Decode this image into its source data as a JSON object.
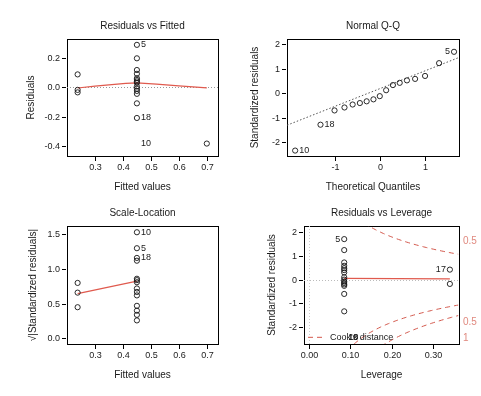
{
  "figure": {
    "background": "#ffffff",
    "axis_color": "#000000",
    "text_color": "#1a1a1a",
    "accent_color": "#e05a4e",
    "cook_color": "#d4594d",
    "layout": "2x2 grid of regression diagnostic plots"
  },
  "chart_data": [
    {
      "type": "scatter",
      "title": "Residuals vs Fitted",
      "xlabel": "Fitted values",
      "ylabel": "Residuals",
      "xlim": [
        0.2,
        0.74
      ],
      "ylim": [
        -0.47,
        0.33
      ],
      "xticks": [
        0.3,
        0.4,
        0.5,
        0.6,
        0.7
      ],
      "xticklabels": [
        "0.3",
        "0.4",
        "0.5",
        "0.6",
        "0.7"
      ],
      "yticks": [
        -0.4,
        -0.2,
        0.0,
        0.2
      ],
      "yticklabels": [
        "-0.4",
        "-0.2",
        "0.0",
        "0.2"
      ],
      "grid": false,
      "legend": "none",
      "x": [
        0.238,
        0.238,
        0.238,
        0.45,
        0.45,
        0.45,
        0.45,
        0.45,
        0.45,
        0.45,
        0.45,
        0.45,
        0.45,
        0.45,
        0.45,
        0.45,
        0.45,
        0.7
      ],
      "y": [
        0.088,
        -0.018,
        -0.035,
        0.29,
        0.198,
        0.118,
        0.092,
        0.062,
        0.05,
        0.04,
        0.03,
        0.005,
        -0.01,
        -0.025,
        -0.045,
        -0.11,
        -0.21,
        -0.385
      ],
      "annotations": [
        {
          "label": "5",
          "x": 0.45,
          "y": 0.29,
          "side": "right"
        },
        {
          "label": "18",
          "x": 0.45,
          "y": -0.21,
          "side": "right"
        },
        {
          "label": "10",
          "x": 0.45,
          "y": -0.385,
          "side": "right"
        }
      ],
      "reference_line": {
        "kind": "zero-dotted",
        "y": 0.0,
        "color": "#999999"
      },
      "smoother": {
        "kind": "lowess",
        "color": "#e05a4e",
        "x": [
          0.238,
          0.3,
          0.36,
          0.41,
          0.45,
          0.52,
          0.6,
          0.7
        ],
        "y": [
          -0.005,
          0.008,
          0.018,
          0.026,
          0.03,
          0.022,
          0.01,
          -0.004
        ]
      }
    },
    {
      "type": "scatter",
      "title": "Normal Q-Q",
      "xlabel": "Theoretical Quantiles",
      "ylabel": "Standardized residuals",
      "xlim": [
        -2.05,
        1.75
      ],
      "ylim": [
        -2.55,
        2.2
      ],
      "xticks": [
        -1,
        0,
        1
      ],
      "xticklabels": [
        "-1",
        "0",
        "1"
      ],
      "yticks": [
        -2,
        -1,
        0,
        1,
        2
      ],
      "yticklabels": [
        "-2",
        "-1",
        "0",
        "1",
        "2"
      ],
      "grid": false,
      "legend": "none",
      "x": [
        -1.87,
        -1.31,
        -1.0,
        -0.78,
        -0.6,
        -0.44,
        -0.29,
        -0.14,
        0.0,
        0.14,
        0.29,
        0.44,
        0.6,
        0.78,
        1.0,
        1.31,
        1.64
      ],
      "y": [
        -2.33,
        -1.28,
        -0.7,
        -0.58,
        -0.46,
        -0.4,
        -0.33,
        -0.25,
        -0.12,
        0.12,
        0.33,
        0.42,
        0.52,
        0.58,
        0.7,
        1.22,
        1.68
      ],
      "annotations": [
        {
          "label": "10",
          "x": -1.87,
          "y": -2.33,
          "side": "right"
        },
        {
          "label": "18",
          "x": -1.31,
          "y": -1.28,
          "side": "right"
        },
        {
          "label": "5",
          "x": 1.64,
          "y": 1.68,
          "side": "left"
        }
      ],
      "reference_line": {
        "kind": "qq-dotted",
        "color": "#555555",
        "p1": [
          -2.05,
          -1.3
        ],
        "p2": [
          1.75,
          1.45
        ]
      }
    },
    {
      "type": "scatter",
      "title": "Scale-Location",
      "xlabel": "Fitted values",
      "ylabel": "√|Standardized residuals|",
      "xlim": [
        0.2,
        0.74
      ],
      "ylim": [
        -0.08,
        1.62
      ],
      "xticks": [
        0.3,
        0.4,
        0.5,
        0.6,
        0.7
      ],
      "xticklabels": [
        "0.3",
        "0.4",
        "0.5",
        "0.6",
        "0.7"
      ],
      "yticks": [
        0.0,
        0.5,
        1.0,
        1.5
      ],
      "yticklabels": [
        "0.0",
        "0.5",
        "1.0",
        "1.5"
      ],
      "grid": false,
      "legend": "none",
      "x": [
        0.238,
        0.238,
        0.238,
        0.45,
        0.45,
        0.45,
        0.45,
        0.45,
        0.45,
        0.45,
        0.45,
        0.45,
        0.45,
        0.45,
        0.45,
        0.45,
        0.45
      ],
      "y": [
        0.8,
        0.66,
        0.45,
        1.53,
        1.3,
        1.16,
        1.12,
        0.86,
        0.84,
        0.81,
        0.72,
        0.67,
        0.62,
        0.47,
        0.4,
        0.34,
        0.26
      ],
      "annotations": [
        {
          "label": "10",
          "x": 0.45,
          "y": 1.53,
          "side": "right"
        },
        {
          "label": "5",
          "x": 0.45,
          "y": 1.3,
          "side": "right"
        },
        {
          "label": "18",
          "x": 0.45,
          "y": 1.16,
          "side": "right"
        }
      ],
      "smoother": {
        "kind": "lowess",
        "color": "#e05a4e",
        "x": [
          0.238,
          0.45
        ],
        "y": [
          0.645,
          0.825
        ]
      }
    },
    {
      "type": "scatter",
      "title": "Residuals vs Leverage",
      "xlabel": "Leverage",
      "ylabel": "Standardized residuals",
      "xlim": [
        -0.012,
        0.362
      ],
      "ylim": [
        -2.7,
        2.25
      ],
      "xticks": [
        0.0,
        0.1,
        0.2,
        0.3
      ],
      "xticklabels": [
        "0.00",
        "0.10",
        "0.20",
        "0.30"
      ],
      "yticks": [
        -2,
        -1,
        0,
        1,
        2
      ],
      "yticklabels": [
        "-2",
        "-1",
        "0",
        "1",
        "2"
      ],
      "grid": false,
      "legend": "Cook's distance",
      "x": [
        0.085,
        0.085,
        0.085,
        0.085,
        0.085,
        0.085,
        0.085,
        0.085,
        0.085,
        0.085,
        0.085,
        0.085,
        0.085,
        0.085,
        0.085,
        0.34,
        0.34
      ],
      "y": [
        1.7,
        1.24,
        0.72,
        0.58,
        0.48,
        0.4,
        0.1,
        0.0,
        -0.08,
        -0.14,
        -0.2,
        -0.26,
        -0.6,
        -1.33,
        0.3,
        0.42,
        -0.18
      ],
      "annotations": [
        {
          "label": "5",
          "x": 0.085,
          "y": 1.7,
          "side": "left"
        },
        {
          "label": "17",
          "x": 0.34,
          "y": 0.42,
          "side": "left"
        },
        {
          "label": "10",
          "x": 0.085,
          "y": -2.42,
          "side": "right"
        },
        {
          "label": "18",
          "x": 0.085,
          "y": -2.42,
          "side": "right"
        }
      ],
      "cooks_contours": [
        {
          "level": "0.5",
          "label": "0.5",
          "position": "top-right"
        },
        {
          "level": "0.5",
          "label": "0.5",
          "position": "bottom-right"
        },
        {
          "level": "1",
          "label": "1",
          "position": "bottom-right-lower"
        }
      ],
      "cook_legend_label": "Cook's distance",
      "reference_line": {
        "kind": "zero-dotted",
        "y": 0.0,
        "color": "#bbbbbb"
      },
      "smoother": {
        "kind": "lowess",
        "color": "#e05a4e",
        "x": [
          0.085,
          0.34
        ],
        "y": [
          0.055,
          0.03
        ]
      }
    }
  ]
}
